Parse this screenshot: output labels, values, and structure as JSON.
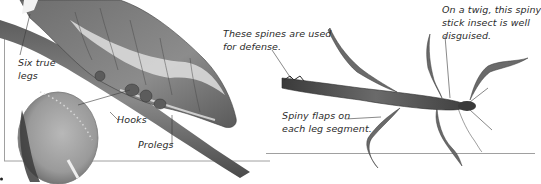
{
  "figure": {
    "left_panel": {
      "subject": "caterpillar-on-branch",
      "inset": "magnified-proleg-hooks",
      "captions": {
        "six_true_legs": "Six true legs",
        "six_true_legs_line1": "Six true",
        "six_true_legs_line2": "legs",
        "hooks": "Hooks",
        "prolegs": "Prolegs"
      }
    },
    "right_panel": {
      "subject": "spiny-stick-insect",
      "captions": {
        "spines_line1": "These spines are used",
        "spines_line2": "for defense.",
        "flaps_line1": "Spiny flaps on",
        "flaps_line2": "each leg segment.",
        "twig_line1": "On a twig, this spiny",
        "twig_line2": "stick insect is well",
        "twig_line3": "disguised."
      }
    }
  },
  "colors": {
    "background": "#ffffff",
    "caption_text": "#2b2b2b",
    "frame_line": "#9a9a9a",
    "insect_dark": "#4a4a4a",
    "insect_mid": "#7a7a7a",
    "insect_light": "#bdbdbd"
  }
}
